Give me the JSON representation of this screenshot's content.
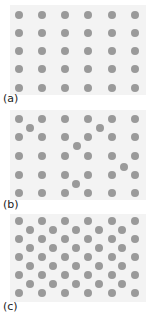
{
  "figure": {
    "panels": [
      {
        "label": "(a)",
        "description": "perfect lattice",
        "top": 5,
        "height": 90,
        "label_y": 93,
        "dots": [
          [
            19,
            15
          ],
          [
            42,
            15
          ],
          [
            65,
            15
          ],
          [
            88,
            15
          ],
          [
            112,
            15
          ],
          [
            135,
            15
          ],
          [
            19,
            33
          ],
          [
            42,
            33
          ],
          [
            65,
            33
          ],
          [
            88,
            33
          ],
          [
            112,
            33
          ],
          [
            135,
            33
          ],
          [
            19,
            51
          ],
          [
            42,
            51
          ],
          [
            65,
            51
          ],
          [
            88,
            51
          ],
          [
            112,
            51
          ],
          [
            135,
            51
          ],
          [
            19,
            69
          ],
          [
            42,
            69
          ],
          [
            65,
            69
          ],
          [
            88,
            69
          ],
          [
            112,
            69
          ],
          [
            135,
            69
          ],
          [
            19,
            88
          ],
          [
            42,
            88
          ],
          [
            65,
            88
          ],
          [
            88,
            88
          ],
          [
            112,
            88
          ],
          [
            135,
            88
          ]
        ]
      },
      {
        "label": "(b)",
        "description": "lattice with interstitial atoms",
        "top": 110,
        "height": 90,
        "label_y": 199,
        "dots": [
          [
            19,
            119
          ],
          [
            42,
            119
          ],
          [
            65,
            119
          ],
          [
            88,
            119
          ],
          [
            112,
            119
          ],
          [
            135,
            119
          ],
          [
            19,
            137
          ],
          [
            42,
            137
          ],
          [
            65,
            137
          ],
          [
            88,
            137
          ],
          [
            112,
            137
          ],
          [
            135,
            137
          ],
          [
            19,
            156
          ],
          [
            42,
            156
          ],
          [
            65,
            156
          ],
          [
            88,
            156
          ],
          [
            112,
            156
          ],
          [
            135,
            156
          ],
          [
            19,
            175
          ],
          [
            42,
            175
          ],
          [
            65,
            175
          ],
          [
            88,
            175
          ],
          [
            112,
            175
          ],
          [
            135,
            175
          ],
          [
            19,
            193
          ],
          [
            42,
            193
          ],
          [
            65,
            193
          ],
          [
            88,
            193
          ],
          [
            112,
            193
          ],
          [
            135,
            193
          ],
          [
            30,
            128
          ],
          [
            100,
            128
          ],
          [
            77,
            146
          ],
          [
            124,
            167
          ],
          [
            76,
            184
          ]
        ]
      },
      {
        "label": "(c)",
        "description": "lattice with interstitials at every site",
        "top": 214,
        "height": 88,
        "label_y": 301,
        "dots": [
          [
            19,
            221
          ],
          [
            42,
            221
          ],
          [
            65,
            221
          ],
          [
            88,
            221
          ],
          [
            112,
            221
          ],
          [
            135,
            221
          ],
          [
            19,
            239
          ],
          [
            42,
            239
          ],
          [
            65,
            239
          ],
          [
            88,
            239
          ],
          [
            112,
            239
          ],
          [
            135,
            239
          ],
          [
            19,
            257
          ],
          [
            42,
            257
          ],
          [
            65,
            257
          ],
          [
            88,
            257
          ],
          [
            112,
            257
          ],
          [
            135,
            257
          ],
          [
            19,
            275
          ],
          [
            42,
            275
          ],
          [
            65,
            275
          ],
          [
            88,
            275
          ],
          [
            112,
            275
          ],
          [
            135,
            275
          ],
          [
            19,
            293
          ],
          [
            42,
            293
          ],
          [
            65,
            293
          ],
          [
            88,
            293
          ],
          [
            112,
            293
          ],
          [
            135,
            293
          ],
          [
            30,
            230
          ],
          [
            53,
            230
          ],
          [
            76,
            230
          ],
          [
            99,
            230
          ],
          [
            122,
            230
          ],
          [
            30,
            248
          ],
          [
            53,
            248
          ],
          [
            76,
            248
          ],
          [
            99,
            248
          ],
          [
            122,
            248
          ],
          [
            30,
            266
          ],
          [
            53,
            266
          ],
          [
            76,
            266
          ],
          [
            99,
            266
          ],
          [
            122,
            266
          ],
          [
            30,
            284
          ],
          [
            53,
            284
          ],
          [
            76,
            284
          ],
          [
            99,
            284
          ],
          [
            122,
            284
          ]
        ]
      }
    ],
    "colors": {
      "background": "#f3f3f3",
      "atom": "#9a9a9a"
    }
  }
}
